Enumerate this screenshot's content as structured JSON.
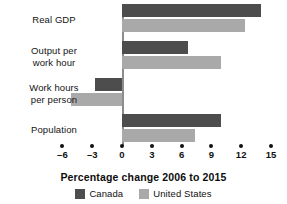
{
  "chart_data": {
    "type": "bar",
    "orientation": "horizontal",
    "title": "",
    "xlabel": "Percentage change 2006 to 2015",
    "ylabel": "",
    "xlim": [
      -7.5,
      16.5
    ],
    "xticks": [
      -6,
      -3,
      0,
      3,
      6,
      9,
      12,
      15
    ],
    "xticklabels": [
      "–6",
      "–3",
      "0",
      "3",
      "6",
      "9",
      "12",
      "15"
    ],
    "grid": false,
    "legend_position": "bottom",
    "categories": [
      "Real GDP",
      "Output per work hour",
      "Work hours per person",
      "Population"
    ],
    "category_label_lines": [
      [
        "Real GDP"
      ],
      [
        "Output per",
        "work hour"
      ],
      [
        "Work hours",
        "per person"
      ],
      [
        "Population"
      ]
    ],
    "series": [
      {
        "name": "Canada",
        "color": "#4d4d4d",
        "values": [
          14.0,
          6.6,
          -2.7,
          10.0
        ]
      },
      {
        "name": "United States",
        "color": "#a9a9a9",
        "values": [
          12.4,
          10.0,
          -5.1,
          7.4
        ]
      }
    ]
  },
  "legend": {
    "items": [
      {
        "label": "Canada",
        "color": "#4d4d4d"
      },
      {
        "label": "United States",
        "color": "#a9a9a9"
      }
    ]
  },
  "axis": {
    "zero_line_color": "#8d8d8d",
    "tick_dot_color": "#111111"
  }
}
